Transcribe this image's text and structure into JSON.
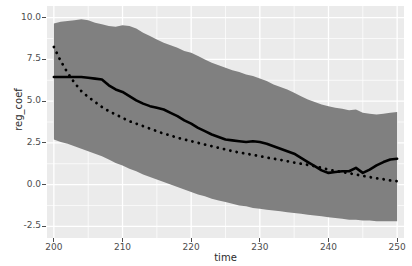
{
  "chart": {
    "type": "line",
    "title": "",
    "xlabel": "time",
    "ylabel": "reg_coef",
    "legend_cropped_text": "",
    "panel_bg": "#ebebeb",
    "grid_color": "#ffffff",
    "ribbon_color": "#808080",
    "line_color": "#000000"
  },
  "axes": {
    "x": {
      "label": "time",
      "ticks": [
        "200",
        "210",
        "220",
        "230",
        "240",
        "250"
      ],
      "values": [
        200,
        210,
        220,
        230,
        240,
        250
      ],
      "min": 199.0,
      "max": 251.0
    },
    "y": {
      "label": "reg_coef",
      "ticks": [
        "10.0",
        "7.5",
        "5.0",
        "2.5",
        "0.0",
        "-2.5"
      ],
      "values": [
        10.0,
        7.5,
        5.0,
        2.5,
        0.0,
        -2.5
      ],
      "min": -3.2,
      "max": 10.7
    }
  },
  "chart_data": {
    "type": "line",
    "title": "",
    "xlabel": "time",
    "ylabel": "reg_coef",
    "xlim": [
      199.0,
      251.0
    ],
    "ylim": [
      -3.2,
      10.7
    ],
    "grid": true,
    "legend_position": "top",
    "x": [
      200,
      201,
      202,
      203,
      204,
      205,
      206,
      207,
      208,
      209,
      210,
      211,
      212,
      213,
      214,
      215,
      216,
      217,
      218,
      219,
      220,
      221,
      222,
      223,
      224,
      225,
      226,
      227,
      228,
      229,
      230,
      231,
      232,
      233,
      234,
      235,
      236,
      237,
      238,
      239,
      240,
      241,
      242,
      243,
      244,
      245,
      246,
      247,
      248,
      249,
      250
    ],
    "series": [
      {
        "name": "solid-line",
        "style": "solid",
        "values": [
          6.45,
          6.45,
          6.45,
          6.45,
          6.45,
          6.4,
          6.35,
          6.3,
          5.95,
          5.7,
          5.55,
          5.3,
          5.05,
          4.85,
          4.7,
          4.6,
          4.5,
          4.3,
          4.1,
          3.85,
          3.65,
          3.4,
          3.2,
          3.0,
          2.85,
          2.7,
          2.65,
          2.6,
          2.55,
          2.6,
          2.55,
          2.45,
          2.3,
          2.15,
          2.0,
          1.85,
          1.6,
          1.35,
          1.1,
          0.85,
          0.7,
          0.75,
          0.8,
          0.8,
          1.0,
          0.7,
          0.9,
          1.15,
          1.35,
          1.5,
          1.55
        ]
      },
      {
        "name": "dotted-line",
        "style": "dotted",
        "values": [
          8.25,
          7.4,
          6.7,
          6.1,
          5.6,
          5.25,
          4.95,
          4.65,
          4.4,
          4.2,
          4.0,
          3.8,
          3.65,
          3.5,
          3.35,
          3.2,
          3.05,
          2.95,
          2.8,
          2.7,
          2.6,
          2.5,
          2.4,
          2.3,
          2.2,
          2.1,
          2.0,
          1.92,
          1.85,
          1.78,
          1.7,
          1.62,
          1.55,
          1.48,
          1.4,
          1.32,
          1.25,
          1.18,
          1.1,
          1.0,
          0.9,
          0.82,
          0.75,
          0.68,
          0.6,
          0.52,
          0.45,
          0.38,
          0.32,
          0.25,
          0.2
        ]
      }
    ],
    "ribbon": {
      "name": "confidence-band",
      "color": "#808080",
      "upper": [
        9.65,
        9.75,
        9.8,
        9.85,
        9.9,
        9.85,
        9.7,
        9.6,
        9.5,
        9.45,
        9.55,
        9.5,
        9.35,
        9.1,
        8.9,
        8.7,
        8.5,
        8.35,
        8.2,
        8.0,
        7.9,
        7.7,
        7.5,
        7.3,
        7.15,
        7.0,
        6.85,
        6.75,
        6.6,
        6.5,
        6.35,
        6.2,
        6.0,
        5.85,
        5.7,
        5.5,
        5.3,
        5.1,
        4.95,
        4.8,
        4.7,
        4.6,
        4.55,
        4.45,
        4.5,
        4.3,
        4.25,
        4.2,
        4.25,
        4.3,
        4.35
      ],
      "lower": [
        2.7,
        2.55,
        2.45,
        2.3,
        2.15,
        2.0,
        1.85,
        1.7,
        1.5,
        1.3,
        1.15,
        0.95,
        0.8,
        0.6,
        0.45,
        0.3,
        0.15,
        0.0,
        -0.15,
        -0.3,
        -0.45,
        -0.6,
        -0.7,
        -0.85,
        -0.95,
        -1.05,
        -1.15,
        -1.25,
        -1.3,
        -1.4,
        -1.45,
        -1.5,
        -1.55,
        -1.6,
        -1.65,
        -1.7,
        -1.75,
        -1.8,
        -1.85,
        -1.9,
        -1.95,
        -2.0,
        -2.05,
        -2.1,
        -2.1,
        -2.15,
        -2.15,
        -2.2,
        -2.2,
        -2.2,
        -2.2
      ]
    }
  }
}
